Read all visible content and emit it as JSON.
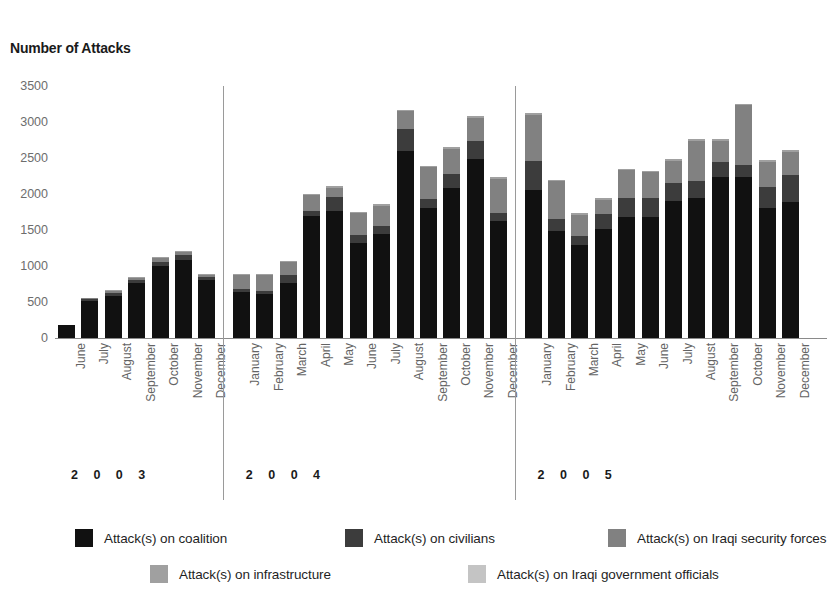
{
  "chart_title": "Number of Attacks",
  "axis": {
    "y_ticks": [
      "3500",
      "3000",
      "2500",
      "2000",
      "1500",
      "1000",
      "500",
      "0"
    ]
  },
  "years": [
    {
      "label": "2 0 0 3"
    },
    {
      "label": "2 0 0 4"
    },
    {
      "label": "2 0 0 5"
    }
  ],
  "legend": {
    "items": [
      {
        "label": "Attack(s) on coalition",
        "color": "#111111"
      },
      {
        "label": "Attack(s) on civilians",
        "color": "#3c3c3c"
      },
      {
        "label": "Attack(s) on Iraqi security forces",
        "color": "#818181"
      },
      {
        "label": "Attack(s) on infrastructure",
        "color": "#a0a0a0"
      },
      {
        "label": "Attack(s) on Iraqi government officials",
        "color": "#c4c4c4"
      }
    ]
  },
  "chart_data": {
    "type": "bar",
    "subtype": "stacked-bar",
    "title": "Number of Attacks",
    "xlabel": "",
    "ylabel": "Number of Attacks",
    "ylim": [
      0,
      3500
    ],
    "ytick_step": 500,
    "grid": false,
    "legend_position": "bottom",
    "categories": [
      "June 2003",
      "July 2003",
      "August 2003",
      "September 2003",
      "October 2003",
      "November 2003",
      "December 2003",
      "January 2004",
      "February 2004",
      "March 2004",
      "April 2004",
      "May 2004",
      "June 2004",
      "July 2004",
      "August 2004",
      "September 2004",
      "October 2004",
      "November 2004",
      "December 2004",
      "January 2005",
      "February 2005",
      "March 2005",
      "April 2005",
      "May 2005",
      "June 2005",
      "July 2005",
      "August 2005",
      "September 2005",
      "October 2005",
      "November 2005",
      "December 2005"
    ],
    "month_labels": [
      "June",
      "July",
      "August",
      "September",
      "October",
      "November",
      "December",
      "January",
      "February",
      "March",
      "April",
      "May",
      "June",
      "July",
      "August",
      "September",
      "October",
      "November",
      "December",
      "January",
      "February",
      "March",
      "April",
      "May",
      "June",
      "July",
      "August",
      "September",
      "October",
      "November",
      "December"
    ],
    "year_groups": [
      {
        "year": "2003",
        "start_index": 0,
        "count": 7
      },
      {
        "year": "2004",
        "start_index": 7,
        "count": 12
      },
      {
        "year": "2005",
        "start_index": 19,
        "count": 12
      }
    ],
    "series": [
      {
        "name": "Attack(s) on coalition",
        "color": "#111111",
        "values": [
          175,
          520,
          590,
          760,
          1000,
          1090,
          810,
          640,
          610,
          760,
          1700,
          1760,
          1320,
          1450,
          2600,
          1800,
          2080,
          2490,
          1620,
          2060,
          1490,
          1290,
          1520,
          1680,
          1680,
          1900,
          1950,
          2230,
          2240,
          1800,
          1890
        ]
      },
      {
        "name": "Attack(s) on civilians",
        "color": "#3c3c3c",
        "values": [
          0,
          20,
          30,
          40,
          60,
          60,
          40,
          40,
          40,
          110,
          70,
          200,
          110,
          110,
          310,
          130,
          200,
          240,
          120,
          400,
          160,
          130,
          200,
          260,
          260,
          250,
          230,
          210,
          170,
          300,
          380
        ]
      },
      {
        "name": "Attack(s) on Iraqi security forces",
        "color": "#818181",
        "values": [
          0,
          20,
          30,
          30,
          50,
          50,
          30,
          190,
          220,
          180,
          210,
          130,
          300,
          280,
          240,
          440,
          350,
          330,
          470,
          640,
          530,
          290,
          200,
          390,
          360,
          310,
          560,
          300,
          820,
          350,
          320
        ]
      },
      {
        "name": "Attack(s) on infrastructure",
        "color": "#a0a0a0",
        "values": [
          0,
          0,
          10,
          10,
          10,
          10,
          10,
          20,
          20,
          20,
          20,
          20,
          20,
          20,
          20,
          20,
          20,
          20,
          20,
          20,
          20,
          20,
          20,
          20,
          20,
          20,
          20,
          20,
          20,
          20,
          20
        ]
      },
      {
        "name": "Attack(s) on Iraqi government officials",
        "color": "#c4c4c4",
        "values": [
          0,
          0,
          0,
          0,
          0,
          0,
          0,
          0,
          0,
          0,
          0,
          0,
          0,
          0,
          0,
          0,
          0,
          0,
          0,
          0,
          0,
          0,
          0,
          0,
          0,
          0,
          0,
          0,
          0,
          0,
          0
        ]
      }
    ],
    "totals": [
      175,
      560,
      660,
      840,
      1120,
      1210,
      890,
      890,
      890,
      1070,
      2000,
      2110,
      1750,
      1860,
      3170,
      2390,
      2650,
      3080,
      2230,
      3120,
      2200,
      1730,
      1940,
      2350,
      2320,
      2480,
      2760,
      2760,
      3250,
      2470,
      2610
    ]
  }
}
